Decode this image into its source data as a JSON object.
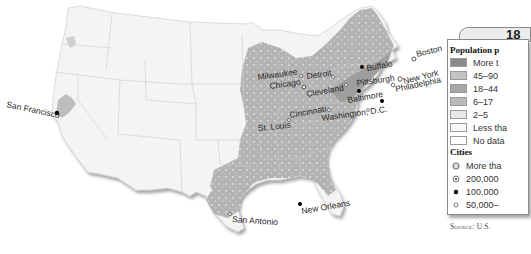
{
  "legend": {
    "year": "18",
    "population_heading": "Population p",
    "density_classes": [
      {
        "label": "More t",
        "color": "#8a8a8a"
      },
      {
        "label": "45–90",
        "color": "#c4c4c4"
      },
      {
        "label": "18–44",
        "color": "#a8a8a8"
      },
      {
        "label": "6–17",
        "color": "#b9b9b9"
      },
      {
        "label": "2–5",
        "color": "#e8e8e8"
      },
      {
        "label": "Less tha",
        "color": "#f7f7f7"
      },
      {
        "label": "No data",
        "color": "#ffffff"
      }
    ],
    "cities_heading": "Cities",
    "city_classes": [
      {
        "label": "More tha",
        "symbol": "ring-large"
      },
      {
        "label": "200,000",
        "symbol": "dotted-circle"
      },
      {
        "label": "100,000",
        "symbol": "filled-dot"
      },
      {
        "label": "50,000–",
        "symbol": "open-circle"
      }
    ],
    "source": "Source: U.S."
  },
  "cities": [
    {
      "name": "San Francisco",
      "symbol": "filled-dot"
    },
    {
      "name": "Milwaukee",
      "symbol": "open-circle"
    },
    {
      "name": "Detroit",
      "symbol": "open-circle"
    },
    {
      "name": "Chicago",
      "symbol": "dotted-circle"
    },
    {
      "name": "Cleveland",
      "symbol": "open-circle"
    },
    {
      "name": "Buffalo",
      "symbol": "filled-dot"
    },
    {
      "name": "Pittsburgh",
      "symbol": "filled-dot"
    },
    {
      "name": "Boston",
      "symbol": "dotted-circle"
    },
    {
      "name": "New York",
      "symbol": "ring-large"
    },
    {
      "name": "Philadelphia",
      "symbol": "dotted-circle"
    },
    {
      "name": "Baltimore",
      "symbol": "filled-dot"
    },
    {
      "name": "Washington, D.C.",
      "symbol": "open-circle"
    },
    {
      "name": "Cincinnati",
      "symbol": "open-circle"
    },
    {
      "name": "St. Louis",
      "symbol": "open-circle"
    },
    {
      "name": "New Orleans",
      "symbol": "filled-dot"
    },
    {
      "name": "San Antonio",
      "symbol": "open-circle"
    }
  ]
}
